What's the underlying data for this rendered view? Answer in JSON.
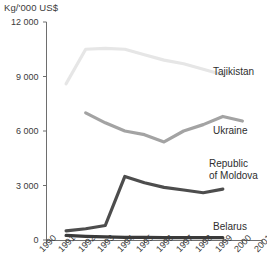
{
  "chart_data": {
    "type": "line",
    "title": "",
    "subtitle": "",
    "xlabel": "",
    "ylabel": "Kg/'000 US$",
    "unit_label": "Kg/'000 US$",
    "x": [
      1990,
      1991,
      1992,
      1993,
      1994,
      1995,
      1996,
      1997,
      1998,
      1999,
      2000,
      2001
    ],
    "xtick_labels": [
      "1990",
      "1991",
      "1992",
      "1993",
      "1994",
      "1995",
      "1996",
      "1997",
      "1998",
      "1999",
      "2000",
      "2001"
    ],
    "ytick_labels": [
      "0",
      "3 000",
      "6 000",
      "9 000",
      "12 000"
    ],
    "ytick_values": [
      0,
      3000,
      6000,
      9000,
      12000
    ],
    "xlim": [
      1990,
      2001
    ],
    "ylim": [
      0,
      12000
    ],
    "grid": false,
    "legend_position": "inline-right-of-series",
    "series": [
      {
        "name": "Tajikistan",
        "color": "#e6e6e6",
        "x": [
          1991,
          1992,
          1993,
          1994,
          1995,
          1996,
          1997,
          1998,
          1999
        ],
        "values": [
          8600,
          10500,
          10550,
          10500,
          10200,
          9900,
          9700,
          9400,
          9100
        ]
      },
      {
        "name": "Ukraine",
        "color": "#a3a3a3",
        "x": [
          1992,
          1993,
          1994,
          1995,
          1996,
          1997,
          1998,
          1999,
          2000
        ],
        "values": [
          7000,
          6450,
          6000,
          5800,
          5400,
          6000,
          6350,
          6800,
          6550
        ]
      },
      {
        "name": "Republic of Moldova",
        "label_lines": [
          "Republic",
          "of Moldova"
        ],
        "color": "#4d4d4d",
        "x": [
          1991,
          1992,
          1993,
          1994,
          1995,
          1996,
          1997,
          1998,
          1999
        ],
        "values": [
          500,
          620,
          800,
          3500,
          3150,
          2900,
          2750,
          2600,
          2800
        ]
      },
      {
        "name": "Belarus",
        "color": "#3a3a3a",
        "x": [
          1991,
          1992,
          1993,
          1994,
          1995,
          1996,
          1997,
          1998,
          1999
        ],
        "values": [
          250,
          200,
          170,
          150,
          140,
          130,
          130,
          130,
          130
        ]
      }
    ],
    "annotations": [
      {
        "text": "Tajikistan",
        "series": "Tajikistan"
      },
      {
        "text": "Ukraine",
        "series": "Ukraine"
      },
      {
        "text": "Republic of Moldova",
        "series": "Republic of Moldova"
      },
      {
        "text": "Belarus",
        "series": "Belarus"
      }
    ]
  }
}
